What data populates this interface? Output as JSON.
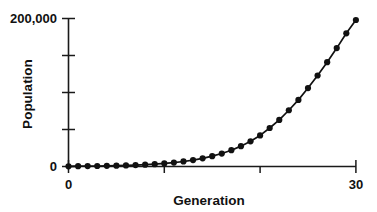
{
  "chart_data": {
    "type": "line",
    "title": "",
    "xlabel": "Generation",
    "ylabel": "Population",
    "xlim": [
      0,
      30
    ],
    "ylim": [
      0,
      200000
    ],
    "grid": false,
    "legend": null,
    "marker": "filled-circle",
    "line_color": "#111111",
    "marker_color": "#111111",
    "x_tick_labels": [
      "0",
      "30"
    ],
    "x_tick_values": [
      0,
      10,
      20,
      30
    ],
    "y_tick_labels": [
      "200,000",
      "0"
    ],
    "y_tick_values": [
      0,
      50000,
      100000,
      150000,
      200000
    ],
    "x": [
      0,
      1,
      2,
      3,
      4,
      5,
      6,
      7,
      8,
      9,
      10,
      11,
      12,
      13,
      14,
      15,
      16,
      17,
      18,
      19,
      20,
      21,
      22,
      23,
      24,
      25,
      26,
      27,
      28,
      29,
      30
    ],
    "values": [
      300,
      400,
      520,
      680,
      900,
      1150,
      1500,
      1950,
      2500,
      3200,
      4100,
      5300,
      6800,
      8700,
      11000,
      14000,
      17500,
      22000,
      27500,
      34000,
      42000,
      52000,
      63000,
      76000,
      90000,
      106000,
      123000,
      141000,
      160000,
      180000,
      198000
    ]
  },
  "axis_labels": {
    "y_top": "200,000",
    "y_zero": "0",
    "x_zero": "0",
    "x_max": "30",
    "y_title": "Population",
    "x_title": "Generation"
  },
  "colors": {
    "background": "#ffffff",
    "ink": "#111111",
    "axis": "#1a1a1a"
  }
}
